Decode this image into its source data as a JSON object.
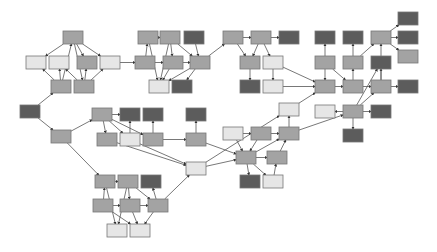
{
  "diagram": {
    "type": "directed-graph",
    "box_size": {
      "w": 20,
      "h": 13
    },
    "colors": {
      "dark": "#5c5c5c",
      "medium": "#a3a3a3",
      "light": "#e6e6e6",
      "edge": "#555555",
      "stroke": "#777777"
    },
    "nodes": [
      {
        "id": "a1",
        "x": 63,
        "y": 31,
        "c": "medium"
      },
      {
        "id": "a2",
        "x": 26,
        "y": 56,
        "c": "light"
      },
      {
        "id": "a3",
        "x": 49,
        "y": 56,
        "c": "light"
      },
      {
        "id": "a4",
        "x": 77,
        "y": 56,
        "c": "medium"
      },
      {
        "id": "a5",
        "x": 100,
        "y": 56,
        "c": "light"
      },
      {
        "id": "a6",
        "x": 51,
        "y": 80,
        "c": "medium"
      },
      {
        "id": "a7",
        "x": 74,
        "y": 80,
        "c": "medium"
      },
      {
        "id": "root",
        "x": 20,
        "y": 105,
        "c": "dark"
      },
      {
        "id": "m0",
        "x": 51,
        "y": 130,
        "c": "medium"
      },
      {
        "id": "b1",
        "x": 138,
        "y": 31,
        "c": "medium"
      },
      {
        "id": "b2",
        "x": 160,
        "y": 31,
        "c": "medium"
      },
      {
        "id": "b3",
        "x": 184,
        "y": 31,
        "c": "dark"
      },
      {
        "id": "b4",
        "x": 135,
        "y": 56,
        "c": "medium"
      },
      {
        "id": "b5",
        "x": 163,
        "y": 56,
        "c": "medium"
      },
      {
        "id": "b6",
        "x": 190,
        "y": 56,
        "c": "medium"
      },
      {
        "id": "b7",
        "x": 149,
        "y": 80,
        "c": "light"
      },
      {
        "id": "b8",
        "x": 172,
        "y": 80,
        "c": "dark"
      },
      {
        "id": "c1",
        "x": 223,
        "y": 31,
        "c": "medium"
      },
      {
        "id": "c2",
        "x": 251,
        "y": 31,
        "c": "medium"
      },
      {
        "id": "c3",
        "x": 279,
        "y": 31,
        "c": "dark"
      },
      {
        "id": "c4",
        "x": 240,
        "y": 56,
        "c": "medium"
      },
      {
        "id": "c5",
        "x": 263,
        "y": 56,
        "c": "light"
      },
      {
        "id": "c6",
        "x": 240,
        "y": 80,
        "c": "dark"
      },
      {
        "id": "c7",
        "x": 263,
        "y": 80,
        "c": "light"
      },
      {
        "id": "c8",
        "x": 279,
        "y": 103,
        "c": "light"
      },
      {
        "id": "d1",
        "x": 315,
        "y": 31,
        "c": "dark"
      },
      {
        "id": "d2",
        "x": 343,
        "y": 31,
        "c": "dark"
      },
      {
        "id": "d3",
        "x": 371,
        "y": 31,
        "c": "medium"
      },
      {
        "id": "d4",
        "x": 398,
        "y": 12,
        "c": "dark"
      },
      {
        "id": "d5",
        "x": 398,
        "y": 31,
        "c": "dark"
      },
      {
        "id": "d6",
        "x": 398,
        "y": 50,
        "c": "medium"
      },
      {
        "id": "d7",
        "x": 315,
        "y": 56,
        "c": "medium"
      },
      {
        "id": "d8",
        "x": 343,
        "y": 56,
        "c": "medium"
      },
      {
        "id": "d9",
        "x": 371,
        "y": 56,
        "c": "dark"
      },
      {
        "id": "d10",
        "x": 315,
        "y": 80,
        "c": "medium"
      },
      {
        "id": "d11",
        "x": 343,
        "y": 80,
        "c": "medium"
      },
      {
        "id": "d12",
        "x": 371,
        "y": 80,
        "c": "medium"
      },
      {
        "id": "d13",
        "x": 398,
        "y": 80,
        "c": "dark"
      },
      {
        "id": "d14",
        "x": 315,
        "y": 105,
        "c": "light"
      },
      {
        "id": "d15",
        "x": 343,
        "y": 105,
        "c": "medium"
      },
      {
        "id": "d16",
        "x": 371,
        "y": 105,
        "c": "dark"
      },
      {
        "id": "d17",
        "x": 343,
        "y": 129,
        "c": "dark"
      },
      {
        "id": "m1",
        "x": 92,
        "y": 108,
        "c": "medium"
      },
      {
        "id": "m2",
        "x": 120,
        "y": 108,
        "c": "dark"
      },
      {
        "id": "m3",
        "x": 143,
        "y": 108,
        "c": "dark"
      },
      {
        "id": "m4",
        "x": 186,
        "y": 108,
        "c": "dark"
      },
      {
        "id": "m5",
        "x": 97,
        "y": 133,
        "c": "medium"
      },
      {
        "id": "m6",
        "x": 120,
        "y": 133,
        "c": "light"
      },
      {
        "id": "m7",
        "x": 143,
        "y": 133,
        "c": "medium"
      },
      {
        "id": "m8",
        "x": 186,
        "y": 133,
        "c": "medium"
      },
      {
        "id": "m9",
        "x": 186,
        "y": 162,
        "c": "light"
      },
      {
        "id": "e1",
        "x": 223,
        "y": 127,
        "c": "light"
      },
      {
        "id": "e2",
        "x": 251,
        "y": 127,
        "c": "medium"
      },
      {
        "id": "e3",
        "x": 279,
        "y": 127,
        "c": "medium"
      },
      {
        "id": "e4",
        "x": 236,
        "y": 151,
        "c": "medium"
      },
      {
        "id": "e5",
        "x": 267,
        "y": 151,
        "c": "medium"
      },
      {
        "id": "e6",
        "x": 240,
        "y": 175,
        "c": "dark"
      },
      {
        "id": "e7",
        "x": 263,
        "y": 175,
        "c": "light"
      },
      {
        "id": "f1",
        "x": 95,
        "y": 175,
        "c": "medium"
      },
      {
        "id": "f2",
        "x": 118,
        "y": 175,
        "c": "medium"
      },
      {
        "id": "f3",
        "x": 141,
        "y": 175,
        "c": "dark"
      },
      {
        "id": "f4",
        "x": 93,
        "y": 199,
        "c": "medium"
      },
      {
        "id": "f5",
        "x": 120,
        "y": 199,
        "c": "medium"
      },
      {
        "id": "f6",
        "x": 148,
        "y": 199,
        "c": "medium"
      },
      {
        "id": "f7",
        "x": 107,
        "y": 224,
        "c": "light"
      },
      {
        "id": "f8",
        "x": 130,
        "y": 224,
        "c": "light"
      }
    ],
    "edges": [
      [
        "root",
        "a6"
      ],
      [
        "root",
        "m0"
      ],
      [
        "a6",
        "a2"
      ],
      [
        "a6",
        "a3"
      ],
      [
        "a6",
        "a1"
      ],
      [
        "a7",
        "a4"
      ],
      [
        "a7",
        "a5"
      ],
      [
        "a7",
        "a3"
      ],
      [
        "a1",
        "a2"
      ],
      [
        "a1",
        "a5"
      ],
      [
        "a1",
        "a4"
      ],
      [
        "a1",
        "a7"
      ],
      [
        "a5",
        "b4"
      ],
      [
        "b4",
        "b5"
      ],
      [
        "b4",
        "b1"
      ],
      [
        "b1",
        "b2"
      ],
      [
        "b2",
        "b5"
      ],
      [
        "b5",
        "b6"
      ],
      [
        "b2",
        "b6"
      ],
      [
        "b3",
        "b6"
      ],
      [
        "b1",
        "b7"
      ],
      [
        "b5",
        "b7"
      ],
      [
        "b6",
        "b7"
      ],
      [
        "b6",
        "b8"
      ],
      [
        "b6",
        "c1"
      ],
      [
        "b2",
        "b7"
      ],
      [
        "c1",
        "c2"
      ],
      [
        "c2",
        "c3"
      ],
      [
        "c1",
        "c4"
      ],
      [
        "c2",
        "c4"
      ],
      [
        "c2",
        "c5"
      ],
      [
        "c4",
        "c6"
      ],
      [
        "c5",
        "c7"
      ],
      [
        "c5",
        "d10"
      ],
      [
        "c7",
        "d10"
      ],
      [
        "c8",
        "d10"
      ],
      [
        "d7",
        "d1"
      ],
      [
        "d8",
        "d2"
      ],
      [
        "d8",
        "d3"
      ],
      [
        "d7",
        "d10"
      ],
      [
        "d7",
        "d11"
      ],
      [
        "d10",
        "d11"
      ],
      [
        "d11",
        "d12"
      ],
      [
        "d11",
        "d8"
      ],
      [
        "d3",
        "d4"
      ],
      [
        "d3",
        "d5"
      ],
      [
        "d3",
        "d6"
      ],
      [
        "d12",
        "d13"
      ],
      [
        "d12",
        "d9"
      ],
      [
        "d15",
        "d14"
      ],
      [
        "d15",
        "d16"
      ],
      [
        "d15",
        "d17"
      ],
      [
        "d15",
        "d12"
      ],
      [
        "d15",
        "d9"
      ],
      [
        "d12",
        "d3"
      ],
      [
        "m0",
        "m1"
      ],
      [
        "m1",
        "m2"
      ],
      [
        "m1",
        "m5"
      ],
      [
        "m1",
        "m6"
      ],
      [
        "m1",
        "m7"
      ],
      [
        "m6",
        "m2"
      ],
      [
        "m7",
        "m3"
      ],
      [
        "m7",
        "m8"
      ],
      [
        "m8",
        "m4"
      ],
      [
        "m8",
        "e4"
      ],
      [
        "m6",
        "m9"
      ],
      [
        "m5",
        "m9"
      ],
      [
        "m9",
        "c8"
      ],
      [
        "m9",
        "e4"
      ],
      [
        "e1",
        "e4"
      ],
      [
        "e2",
        "e4"
      ],
      [
        "e1",
        "e2"
      ],
      [
        "e2",
        "e3"
      ],
      [
        "e4",
        "e3"
      ],
      [
        "e4",
        "e5"
      ],
      [
        "e4",
        "e6"
      ],
      [
        "e4",
        "e7"
      ],
      [
        "e7",
        "e5"
      ],
      [
        "e5",
        "e3"
      ],
      [
        "e3",
        "c8"
      ],
      [
        "e3",
        "d15"
      ],
      [
        "m0",
        "f1"
      ],
      [
        "f4",
        "f1"
      ],
      [
        "f1",
        "f2"
      ],
      [
        "f2",
        "f5"
      ],
      [
        "f4",
        "f5"
      ],
      [
        "f5",
        "f6"
      ],
      [
        "f6",
        "f3"
      ],
      [
        "f6",
        "m9"
      ],
      [
        "f2",
        "f6"
      ],
      [
        "f1",
        "f7"
      ],
      [
        "f2",
        "f7"
      ],
      [
        "f5",
        "f8"
      ],
      [
        "f6",
        "f8"
      ],
      [
        "f4",
        "f8"
      ]
    ]
  }
}
